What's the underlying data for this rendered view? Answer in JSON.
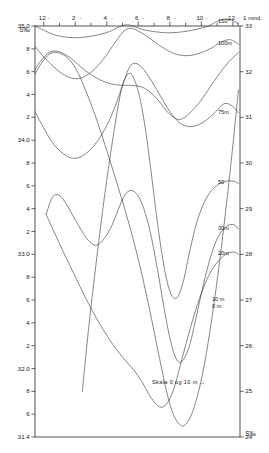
{
  "figure": {
    "background_color": "#ffffff",
    "line_color": "#3a3a3a",
    "frame_color": "#262626"
  },
  "chart_data": {
    "type": "line",
    "title": "",
    "subtitle": "",
    "xlabel": "1 mnd.",
    "ylabel": "S‰",
    "ylabel_right": "S‰",
    "grid": false,
    "legend_position": "inline-right",
    "annotation": "Skala 0 og 10 m →",
    "x_axis": {
      "position": "top",
      "tick_labels": [
        "12",
        "2",
        "4",
        "6",
        "8",
        "10",
        "12"
      ],
      "tick_values": [
        12,
        2,
        4,
        6,
        8,
        10,
        12
      ],
      "end_label": "1 mnd.",
      "minor_ticks_between": 1,
      "xlim": [
        0,
        13
      ]
    },
    "y_axis_left": {
      "position": "left",
      "title": "S‰",
      "tick_labels": [
        "35.0",
        "8",
        "6",
        "4",
        "2",
        "34.0",
        "8",
        "6",
        "4",
        "2",
        "33.0",
        "8",
        "6",
        "4",
        "2",
        "32.0",
        "8",
        "6",
        "31.4"
      ],
      "tick_values": [
        35.0,
        34.8,
        34.6,
        34.4,
        34.2,
        34.0,
        33.8,
        33.6,
        33.4,
        33.2,
        33.0,
        32.8,
        32.6,
        32.4,
        32.2,
        32.0,
        31.8,
        31.6,
        31.4
      ],
      "ylim": [
        31.4,
        35.0
      ],
      "applies_to_depths": [
        "150 m",
        "100 m",
        "75 m",
        "50",
        "30 m",
        "20 m"
      ]
    },
    "y_axis_right": {
      "position": "right",
      "title": "S‰",
      "tick_labels": [
        "33",
        "32",
        "31",
        "30",
        "29",
        "28",
        "27",
        "26",
        "25",
        "24"
      ],
      "tick_values": [
        33,
        32,
        31,
        30,
        29,
        28,
        27,
        26,
        25,
        24
      ],
      "ylim": [
        24,
        33
      ],
      "applies_to_depths": [
        "10 m",
        "0 m"
      ]
    },
    "series": [
      {
        "name": "150 m",
        "label": "150ᵐ",
        "axis": "left",
        "x": [
          0.0,
          0.6,
          1.3,
          2.1,
          3.0,
          3.9,
          4.7,
          5.3,
          5.8,
          6.2,
          6.8,
          7.6,
          8.5,
          9.4,
          10.2,
          11.0,
          11.7,
          12.3,
          12.9
        ],
        "values": [
          35.0,
          34.96,
          34.92,
          34.9,
          34.9,
          34.92,
          34.95,
          34.99,
          35.01,
          35.0,
          34.97,
          34.95,
          34.94,
          34.95,
          34.97,
          35.0,
          35.05,
          35.06,
          35.02
        ]
      },
      {
        "name": "100 m",
        "label": "100m",
        "axis": "left",
        "x": [
          0.0,
          0.5,
          1.2,
          2.0,
          2.8,
          3.6,
          4.4,
          5.1,
          5.6,
          6.0,
          6.5,
          7.2,
          8.0,
          8.8,
          9.6,
          10.4,
          11.1,
          11.8,
          12.4,
          12.9
        ],
        "values": [
          34.82,
          34.74,
          34.64,
          34.56,
          34.54,
          34.6,
          34.72,
          34.86,
          34.95,
          34.98,
          34.96,
          34.9,
          34.82,
          34.76,
          34.74,
          34.76,
          34.8,
          34.86,
          34.88,
          34.84
        ]
      },
      {
        "name": "75 m",
        "label": "75m",
        "axis": "left",
        "x": [
          0.0,
          0.5,
          1.1,
          1.8,
          2.5,
          3.2,
          3.9,
          4.6,
          5.2,
          5.7,
          6.1,
          6.6,
          7.2,
          7.9,
          8.6,
          9.3,
          10.0,
          10.7,
          11.4,
          12.0,
          12.5,
          12.9
        ],
        "values": [
          34.25,
          34.12,
          33.98,
          33.88,
          33.84,
          33.88,
          33.98,
          34.14,
          34.34,
          34.54,
          34.66,
          34.66,
          34.56,
          34.4,
          34.24,
          34.14,
          34.12,
          34.16,
          34.24,
          34.32,
          34.3,
          34.24
        ]
      },
      {
        "name": "50",
        "label": "50",
        "axis": "left",
        "x": [
          3.0,
          3.4,
          3.9,
          4.4,
          4.9,
          5.3,
          5.6,
          5.9,
          6.2,
          6.6,
          7.0,
          7.4,
          7.8,
          8.2,
          8.6,
          9.0,
          9.4,
          9.8,
          10.3,
          10.9,
          11.5,
          12.1,
          12.6,
          12.9
        ],
        "values": [
          31.8,
          32.35,
          32.95,
          33.5,
          33.98,
          34.32,
          34.5,
          34.58,
          34.56,
          34.4,
          34.1,
          33.68,
          33.24,
          32.88,
          32.66,
          32.62,
          32.76,
          33.02,
          33.3,
          33.5,
          33.6,
          33.64,
          33.64,
          33.62
        ]
      },
      {
        "name": "30 m",
        "label": "30m",
        "axis": "left",
        "x": [
          0.7,
          1.1,
          1.5,
          1.9,
          2.4,
          2.9,
          3.4,
          3.9,
          4.4,
          4.9,
          5.3,
          5.7,
          6.1,
          6.5,
          6.9,
          7.3,
          7.7,
          8.1,
          8.5,
          8.9,
          9.3,
          9.8,
          10.3,
          10.9,
          11.5,
          12.1,
          12.6,
          12.9
        ],
        "values": [
          33.35,
          33.5,
          33.52,
          33.46,
          33.34,
          33.22,
          33.12,
          33.08,
          33.14,
          33.26,
          33.4,
          33.52,
          33.56,
          33.52,
          33.4,
          33.2,
          32.92,
          32.6,
          32.3,
          32.1,
          32.06,
          32.2,
          32.5,
          32.86,
          33.12,
          33.24,
          33.26,
          33.22
        ]
      },
      {
        "name": "20 m",
        "label": "20m",
        "axis": "left",
        "x": [
          0.7,
          1.2,
          1.8,
          2.5,
          3.2,
          3.9,
          4.6,
          5.2,
          5.8,
          6.3,
          6.8,
          7.2,
          7.6,
          8.0,
          8.4,
          8.8,
          9.2,
          9.7,
          10.3,
          10.9,
          11.5,
          12.1,
          12.6,
          12.9
        ],
        "values": [
          33.35,
          33.2,
          33.02,
          32.82,
          32.62,
          32.44,
          32.28,
          32.16,
          32.06,
          31.98,
          31.88,
          31.78,
          31.7,
          31.66,
          31.7,
          31.82,
          32.02,
          32.28,
          32.56,
          32.78,
          32.92,
          33.0,
          33.02,
          33.0
        ]
      },
      {
        "name": "10 m",
        "label": "10 m",
        "axis": "right",
        "x": [
          0.0,
          0.4,
          0.9,
          1.4,
          2.0,
          2.6,
          3.2,
          3.8,
          4.4,
          5.0,
          5.6,
          6.2,
          6.8,
          7.3,
          7.8,
          8.2,
          8.6,
          9.0,
          9.4,
          9.9,
          10.5,
          11.1,
          11.7,
          12.3,
          12.9
        ],
        "values": [
          32.05,
          32.25,
          32.42,
          32.45,
          32.36,
          32.2,
          32.02,
          31.88,
          31.78,
          31.72,
          31.7,
          31.7,
          31.66,
          31.55,
          31.38,
          31.2,
          31.05,
          30.96,
          30.98,
          31.12,
          31.36,
          31.66,
          31.96,
          32.22,
          32.42
        ]
      },
      {
        "name": "0 m",
        "label": "0 m",
        "axis": "right",
        "x": [
          0.0,
          0.4,
          0.9,
          1.4,
          2.0,
          2.6,
          3.2,
          3.9,
          4.6,
          5.3,
          6.0,
          6.6,
          7.1,
          7.5,
          7.9,
          8.3,
          8.7,
          9.1,
          9.5,
          10.0,
          10.6,
          11.2,
          11.8,
          12.4,
          12.9
        ],
        "values": [
          31.95,
          32.18,
          32.38,
          32.42,
          32.32,
          32.06,
          31.6,
          30.96,
          30.22,
          29.44,
          28.62,
          27.82,
          27.06,
          26.4,
          25.72,
          25.06,
          24.56,
          24.3,
          24.26,
          24.56,
          25.34,
          26.56,
          28.1,
          29.9,
          31.6
        ]
      }
    ]
  }
}
